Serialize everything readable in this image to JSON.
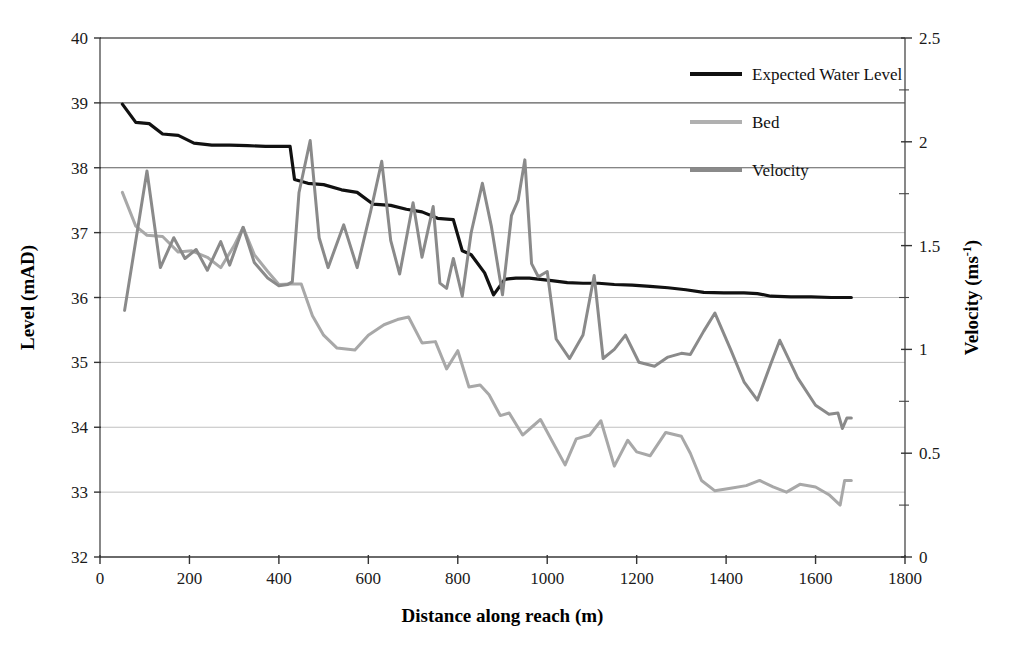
{
  "chart_data": {
    "type": "line",
    "title": "",
    "xlabel": "Distance along reach (m)",
    "ylabel": "Level (mAD)",
    "y2label": "Velocity (ms-1)",
    "y2label_base": "Velocity (ms",
    "y2label_exp": "-1",
    "y2label_tail": ")",
    "xlim": [
      0,
      1800
    ],
    "ylim": [
      32,
      40
    ],
    "y2lim": [
      0,
      2.5
    ],
    "grid": true,
    "grid_axis": "y",
    "legend_position": "top-right",
    "xticks": [
      0,
      200,
      400,
      600,
      800,
      1000,
      1200,
      1400,
      1600,
      1800
    ],
    "yticks": [
      32,
      33,
      34,
      35,
      36,
      37,
      38,
      39,
      40
    ],
    "y2ticks": [
      0,
      0.5,
      1,
      1.5,
      2,
      2.5
    ],
    "y2minorticks": [
      0.25,
      0.75,
      1.25,
      1.75,
      2.25
    ],
    "xtick_labels": [
      "0",
      "200",
      "400",
      "600",
      "800",
      "1000",
      "1200",
      "1400",
      "1600",
      "1800"
    ],
    "ytick_labels": [
      "32",
      "33",
      "34",
      "35",
      "36",
      "37",
      "38",
      "39",
      "40"
    ],
    "y2tick_labels": [
      "0",
      "0.5",
      "1",
      "1.5",
      "2",
      "2.5"
    ],
    "colors": {
      "expected_water_level": "#111111",
      "bed": "#a8a8a8",
      "velocity": "#8a8a8a",
      "grid": "#b9b9b9",
      "axis": "#555555"
    },
    "series": [
      {
        "name": "Expected Water Level",
        "axis": "left",
        "unit": "mAD",
        "color": "#111111",
        "width": 3.2,
        "points": [
          [
            50,
            38.98
          ],
          [
            80,
            38.7
          ],
          [
            110,
            38.68
          ],
          [
            140,
            38.52
          ],
          [
            175,
            38.5
          ],
          [
            210,
            38.38
          ],
          [
            250,
            38.35
          ],
          [
            290,
            38.35
          ],
          [
            330,
            38.34
          ],
          [
            370,
            38.33
          ],
          [
            410,
            38.33
          ],
          [
            425,
            38.33
          ],
          [
            435,
            37.82
          ],
          [
            465,
            37.76
          ],
          [
            500,
            37.74
          ],
          [
            540,
            37.66
          ],
          [
            575,
            37.62
          ],
          [
            610,
            37.44
          ],
          [
            650,
            37.42
          ],
          [
            685,
            37.36
          ],
          [
            720,
            37.32
          ],
          [
            755,
            37.22
          ],
          [
            790,
            37.2
          ],
          [
            810,
            36.72
          ],
          [
            830,
            36.66
          ],
          [
            860,
            36.38
          ],
          [
            880,
            36.04
          ],
          [
            905,
            36.28
          ],
          [
            930,
            36.3
          ],
          [
            960,
            36.3
          ],
          [
            985,
            36.28
          ],
          [
            1010,
            36.26
          ],
          [
            1045,
            36.23
          ],
          [
            1080,
            36.22
          ],
          [
            1115,
            36.22
          ],
          [
            1150,
            36.2
          ],
          [
            1190,
            36.19
          ],
          [
            1230,
            36.17
          ],
          [
            1270,
            36.15
          ],
          [
            1310,
            36.12
          ],
          [
            1350,
            36.08
          ],
          [
            1395,
            36.07
          ],
          [
            1440,
            36.07
          ],
          [
            1470,
            36.06
          ],
          [
            1500,
            36.02
          ],
          [
            1545,
            36.01
          ],
          [
            1590,
            36.01
          ],
          [
            1635,
            36.0
          ],
          [
            1680,
            36.0
          ]
        ]
      },
      {
        "name": "Bed",
        "axis": "left",
        "unit": "mAD",
        "color": "#a8a8a8",
        "width": 3.0,
        "points": [
          [
            50,
            37.62
          ],
          [
            80,
            37.1
          ],
          [
            105,
            36.96
          ],
          [
            140,
            36.94
          ],
          [
            175,
            36.7
          ],
          [
            205,
            36.72
          ],
          [
            240,
            36.62
          ],
          [
            270,
            36.46
          ],
          [
            300,
            36.8
          ],
          [
            320,
            37.08
          ],
          [
            345,
            36.66
          ],
          [
            375,
            36.4
          ],
          [
            400,
            36.2
          ],
          [
            425,
            36.21
          ],
          [
            450,
            36.21
          ],
          [
            475,
            35.72
          ],
          [
            500,
            35.42
          ],
          [
            530,
            35.22
          ],
          [
            570,
            35.19
          ],
          [
            600,
            35.42
          ],
          [
            635,
            35.58
          ],
          [
            665,
            35.66
          ],
          [
            690,
            35.7
          ],
          [
            720,
            35.3
          ],
          [
            750,
            35.32
          ],
          [
            775,
            34.9
          ],
          [
            800,
            35.18
          ],
          [
            825,
            34.62
          ],
          [
            850,
            34.65
          ],
          [
            870,
            34.5
          ],
          [
            895,
            34.18
          ],
          [
            915,
            34.22
          ],
          [
            945,
            33.88
          ],
          [
            965,
            34.0
          ],
          [
            985,
            34.12
          ],
          [
            1010,
            33.8
          ],
          [
            1040,
            33.42
          ],
          [
            1065,
            33.82
          ],
          [
            1095,
            33.88
          ],
          [
            1120,
            34.1
          ],
          [
            1150,
            33.4
          ],
          [
            1180,
            33.8
          ],
          [
            1200,
            33.62
          ],
          [
            1230,
            33.56
          ],
          [
            1265,
            33.92
          ],
          [
            1300,
            33.86
          ],
          [
            1320,
            33.6
          ],
          [
            1345,
            33.18
          ],
          [
            1375,
            33.02
          ],
          [
            1410,
            33.06
          ],
          [
            1445,
            33.1
          ],
          [
            1475,
            33.18
          ],
          [
            1505,
            33.08
          ],
          [
            1535,
            33.0
          ],
          [
            1565,
            33.12
          ],
          [
            1600,
            33.08
          ],
          [
            1630,
            32.96
          ],
          [
            1655,
            32.8
          ],
          [
            1665,
            33.18
          ],
          [
            1680,
            33.18
          ]
        ]
      },
      {
        "name": "Velocity",
        "axis": "right",
        "unit": "ms-1",
        "color": "#8a8a8a",
        "width": 3.0,
        "level_equiv_points": [
          [
            55,
            35.8
          ],
          [
            105,
            37.95
          ],
          [
            135,
            36.46
          ],
          [
            165,
            36.92
          ],
          [
            190,
            36.6
          ],
          [
            215,
            36.74
          ],
          [
            240,
            36.42
          ],
          [
            270,
            36.86
          ],
          [
            290,
            36.5
          ],
          [
            320,
            37.08
          ],
          [
            345,
            36.54
          ],
          [
            375,
            36.3
          ],
          [
            400,
            36.18
          ],
          [
            420,
            36.2
          ],
          [
            430,
            36.24
          ],
          [
            445,
            37.62
          ],
          [
            470,
            38.42
          ],
          [
            490,
            36.92
          ],
          [
            510,
            36.46
          ],
          [
            545,
            37.12
          ],
          [
            575,
            36.46
          ],
          [
            605,
            37.32
          ],
          [
            630,
            38.1
          ],
          [
            650,
            36.88
          ],
          [
            670,
            36.36
          ],
          [
            700,
            37.46
          ],
          [
            720,
            36.62
          ],
          [
            745,
            37.4
          ],
          [
            760,
            36.22
          ],
          [
            775,
            36.14
          ],
          [
            790,
            36.6
          ],
          [
            810,
            36.02
          ],
          [
            830,
            37.0
          ],
          [
            855,
            37.76
          ],
          [
            875,
            37.1
          ],
          [
            900,
            36.04
          ],
          [
            920,
            37.26
          ],
          [
            935,
            37.5
          ],
          [
            950,
            38.12
          ],
          [
            965,
            36.52
          ],
          [
            980,
            36.32
          ],
          [
            1000,
            36.4
          ],
          [
            1020,
            35.36
          ],
          [
            1050,
            35.06
          ],
          [
            1080,
            35.42
          ],
          [
            1105,
            36.34
          ],
          [
            1125,
            35.06
          ],
          [
            1150,
            35.2
          ],
          [
            1175,
            35.42
          ],
          [
            1205,
            35.0
          ],
          [
            1240,
            34.94
          ],
          [
            1270,
            35.08
          ],
          [
            1300,
            35.14
          ],
          [
            1320,
            35.12
          ],
          [
            1350,
            35.48
          ],
          [
            1375,
            35.76
          ],
          [
            1410,
            35.2
          ],
          [
            1440,
            34.7
          ],
          [
            1470,
            34.42
          ],
          [
            1500,
            34.98
          ],
          [
            1520,
            35.34
          ],
          [
            1560,
            34.76
          ],
          [
            1600,
            34.34
          ],
          [
            1630,
            34.2
          ],
          [
            1650,
            34.22
          ],
          [
            1660,
            33.98
          ],
          [
            1670,
            34.14
          ],
          [
            1680,
            34.14
          ]
        ],
        "points": [
          [
            55,
            1.188
          ],
          [
            105,
            1.859
          ],
          [
            135,
            1.394
          ],
          [
            165,
            1.538
          ],
          [
            190,
            1.438
          ],
          [
            215,
            1.481
          ],
          [
            240,
            1.381
          ],
          [
            270,
            1.519
          ],
          [
            290,
            1.406
          ],
          [
            320,
            1.588
          ],
          [
            345,
            1.419
          ],
          [
            375,
            1.344
          ],
          [
            400,
            1.306
          ],
          [
            420,
            1.313
          ],
          [
            430,
            1.325
          ],
          [
            445,
            1.756
          ],
          [
            470,
            2.006
          ],
          [
            490,
            1.538
          ],
          [
            510,
            1.394
          ],
          [
            545,
            1.6
          ],
          [
            575,
            1.394
          ],
          [
            605,
            1.663
          ],
          [
            630,
            1.906
          ],
          [
            650,
            1.525
          ],
          [
            670,
            1.363
          ],
          [
            700,
            1.706
          ],
          [
            720,
            1.444
          ],
          [
            745,
            1.688
          ],
          [
            760,
            1.319
          ],
          [
            775,
            1.294
          ],
          [
            790,
            1.438
          ],
          [
            810,
            1.256
          ],
          [
            830,
            1.563
          ],
          [
            855,
            1.8
          ],
          [
            875,
            1.594
          ],
          [
            900,
            1.263
          ],
          [
            920,
            1.644
          ],
          [
            935,
            1.719
          ],
          [
            950,
            1.913
          ],
          [
            965,
            1.413
          ],
          [
            980,
            1.35
          ],
          [
            1000,
            1.375
          ],
          [
            1020,
            1.05
          ],
          [
            1050,
            0.956
          ],
          [
            1080,
            1.069
          ],
          [
            1105,
            1.356
          ],
          [
            1125,
            0.956
          ],
          [
            1150,
            1.0
          ],
          [
            1175,
            1.069
          ],
          [
            1205,
            0.938
          ],
          [
            1240,
            0.919
          ],
          [
            1270,
            0.963
          ],
          [
            1300,
            0.981
          ],
          [
            1320,
            0.975
          ],
          [
            1350,
            1.088
          ],
          [
            1375,
            1.175
          ],
          [
            1410,
            1.0
          ],
          [
            1440,
            0.844
          ],
          [
            1470,
            0.756
          ],
          [
            1500,
            0.931
          ],
          [
            1520,
            1.044
          ],
          [
            1560,
            0.863
          ],
          [
            1600,
            0.731
          ],
          [
            1630,
            0.688
          ],
          [
            1650,
            0.694
          ],
          [
            1660,
            0.619
          ],
          [
            1670,
            0.669
          ],
          [
            1680,
            0.669
          ]
        ]
      }
    ],
    "legend": [
      {
        "label": "Expected Water Level",
        "color": "#111111",
        "width": 4
      },
      {
        "label": "Bed",
        "color": "#b0b0b0",
        "width": 4
      },
      {
        "label": "Velocity",
        "color": "#8a8a8a",
        "width": 4
      }
    ]
  }
}
